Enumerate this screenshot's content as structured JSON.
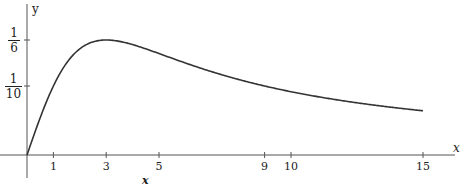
{
  "chart_data": {
    "type": "line",
    "function": "y = x/(x^2+9)",
    "series": [
      {
        "name": "curve",
        "x": [
          0,
          0.5,
          1,
          1.5,
          2,
          2.5,
          3,
          3.5,
          4,
          4.5,
          5,
          6,
          7,
          8,
          9,
          10,
          11,
          12,
          13,
          14,
          15
        ],
        "values": [
          0,
          0.0541,
          0.1,
          0.1333,
          0.1538,
          0.1639,
          0.1667,
          0.1647,
          0.16,
          0.1538,
          0.1471,
          0.1333,
          0.1207,
          0.1096,
          0.1,
          0.0917,
          0.0846,
          0.0784,
          0.073,
          0.0683,
          0.0641
        ]
      }
    ],
    "title": "",
    "xlabel": "x",
    "ylabel": "y",
    "x_ticks": [
      "1",
      "3",
      "5",
      "9",
      "10",
      "15"
    ],
    "x_tick_values": [
      1,
      3,
      5,
      9,
      10,
      15
    ],
    "y_ticks": [
      "1/6",
      "1/10"
    ],
    "y_tick_values": [
      0.1667,
      0.1
    ],
    "xlim": [
      -1,
      16.3
    ],
    "ylim": [
      -0.03,
      0.22
    ],
    "grid": false,
    "legend": "none"
  },
  "labels": {
    "y_axis": "y",
    "x_axis_end": "x",
    "x_below": "x",
    "y_tick_1_num": "1",
    "y_tick_1_den": "6",
    "y_tick_2_num": "1",
    "y_tick_2_den": "10"
  }
}
